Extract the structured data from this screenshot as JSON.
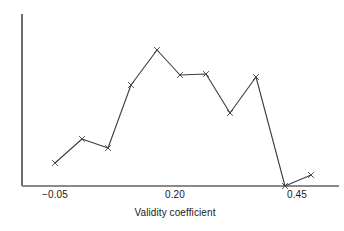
{
  "figure": {
    "background_color": "#ffffff",
    "axis_color": "#6e6e6e",
    "line_color": "#3c3c46",
    "marker_color": "#3c3c46",
    "text_color": "#1a1a1a",
    "width": 344,
    "height": 231
  },
  "axes": {
    "x_title": "Validity coefficient",
    "x_tick_labels": [
      "−0.05",
      "0.20",
      "0.45"
    ],
    "x_tick_values": [
      -0.05,
      0.2,
      0.45
    ],
    "x_tick_pixels": [
      55,
      175,
      297
    ],
    "y_tick_labels": [],
    "x_axis_line_y": 186,
    "y_axis_line_x": 22,
    "y_axis_top": 14,
    "x_axis_left": 22,
    "x_axis_right": 339
  },
  "chart_data": {
    "type": "line",
    "title": "",
    "subtitle": "",
    "xlabel": "Validity coefficient",
    "ylabel": "",
    "grid": false,
    "legend": null,
    "marker": "x",
    "xlim": [
      -0.1,
      0.5
    ],
    "ylim": [
      0,
      1
    ],
    "x": [
      -0.05,
      0.005,
      0.06,
      0.107,
      0.16,
      0.21,
      0.26,
      0.31,
      0.37,
      0.43,
      0.48
    ],
    "y": [
      0.134,
      0.273,
      0.221,
      0.587,
      0.791,
      0.645,
      0.651,
      0.424,
      0.634,
      0.0,
      0.064
    ],
    "points_px": [
      [
        55,
        163
      ],
      [
        82,
        139
      ],
      [
        108,
        148
      ],
      [
        131,
        85
      ],
      [
        157,
        50
      ],
      [
        180,
        75
      ],
      [
        206,
        74
      ],
      [
        230,
        113
      ],
      [
        256,
        77
      ],
      [
        285,
        186
      ],
      [
        311,
        175
      ]
    ],
    "n_points": 11
  }
}
